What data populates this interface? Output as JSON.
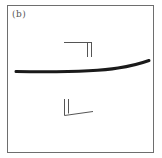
{
  "panel": {
    "label": "(b)"
  },
  "colors": {
    "frame": "#6e6e6e",
    "curve": "#1a1a1a",
    "symbols": "#555555",
    "background": "#ffffff"
  },
  "elements": {
    "main_curve": "thick curved line",
    "upper_symbol": "right-angle bracket with double vertical stroke",
    "lower_symbol": "L-shaped mark with double vertical stroke"
  }
}
